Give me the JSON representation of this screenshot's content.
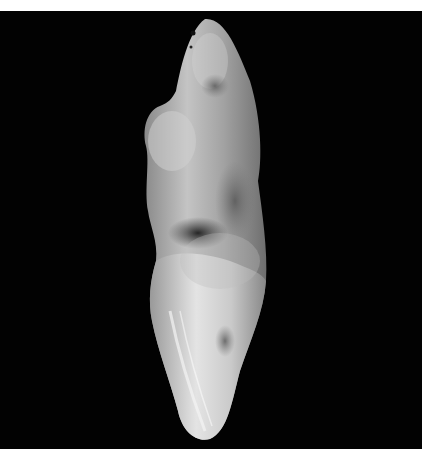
{
  "image": {
    "subject": "extracted tooth specimen",
    "background_color": "#020202",
    "page_background": "#ffffff",
    "colors": {
      "enamel_light": "#e6e6e6",
      "tooth_mid": "#a9a9a9",
      "tooth_dark": "#6a6a6a",
      "stain_dark": "#2a2a2a"
    }
  }
}
